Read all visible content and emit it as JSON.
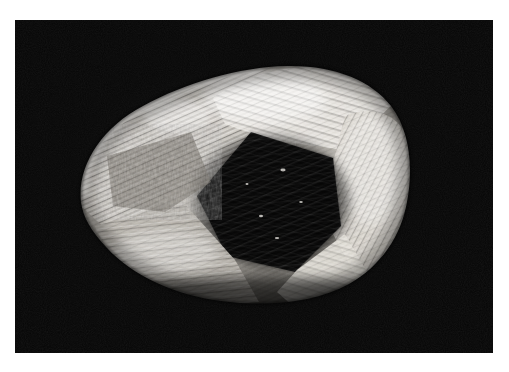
{
  "image": {
    "kind": "photograph",
    "medium": "black-and-white film photograph",
    "subject": "rough diamond crystal specimen",
    "orientation": "landscape",
    "alt_text": "Black and white macro photograph of a rounded dodecahedral rough diamond crystal with strongly striated faces, lit from upper left, against a plain black background, surrounded by a white photographic print border.",
    "caption": "",
    "title": ""
  },
  "canvas": {
    "width_px": 509,
    "height_px": 372,
    "background_color": "#ffffff"
  },
  "border": {
    "name": "white-photo-border",
    "color": "#ffffff",
    "top_px": 20,
    "bottom_px": 19,
    "left_px": 15,
    "right_px": 16
  },
  "plate": {
    "name": "photographic-plate",
    "background_color": "#050505",
    "left_px": 15,
    "top_px": 20,
    "width_px": 478,
    "height_px": 333,
    "grain": true,
    "vignette": true
  },
  "specimen": {
    "name": "crystal-specimen",
    "shape": "rounded dodecahedral / ovoid",
    "bounds_px": {
      "left": 63,
      "top": 55,
      "width": 345,
      "height": 240
    },
    "highlight_color": "#f2f0ec",
    "midtone_color": "#9a968f",
    "shadow_color": "#111111",
    "light_direction": "upper-left",
    "surface_texture": "parallel striations / trigons",
    "facets": [
      {
        "name": "upper-left-bright-facet",
        "tone": "highlight",
        "description": "Brightly lit curved upper-left face with fine diagonal striations"
      },
      {
        "name": "upper-crest-facet",
        "tone": "highlight",
        "description": "Top crest catching the strongest specular light"
      },
      {
        "name": "central-dark-facet",
        "tone": "deep-shadow",
        "description": "Large triangular shadowed depression at the centre of the stone"
      },
      {
        "name": "right-bright-facet",
        "tone": "highlight",
        "description": "Broad pale face on the right flank falling away to the edge"
      },
      {
        "name": "lower-left-facet",
        "tone": "midtone",
        "description": "Lower-left face with coarse horizontal striations"
      },
      {
        "name": "lower-right-edge-facet",
        "tone": "highlight",
        "description": "Narrow bright sliver along the lower-right girdle"
      },
      {
        "name": "left-rough-patch",
        "tone": "mid-shadow",
        "description": "Pitted, irregular etched area on the left shoulder"
      }
    ]
  }
}
